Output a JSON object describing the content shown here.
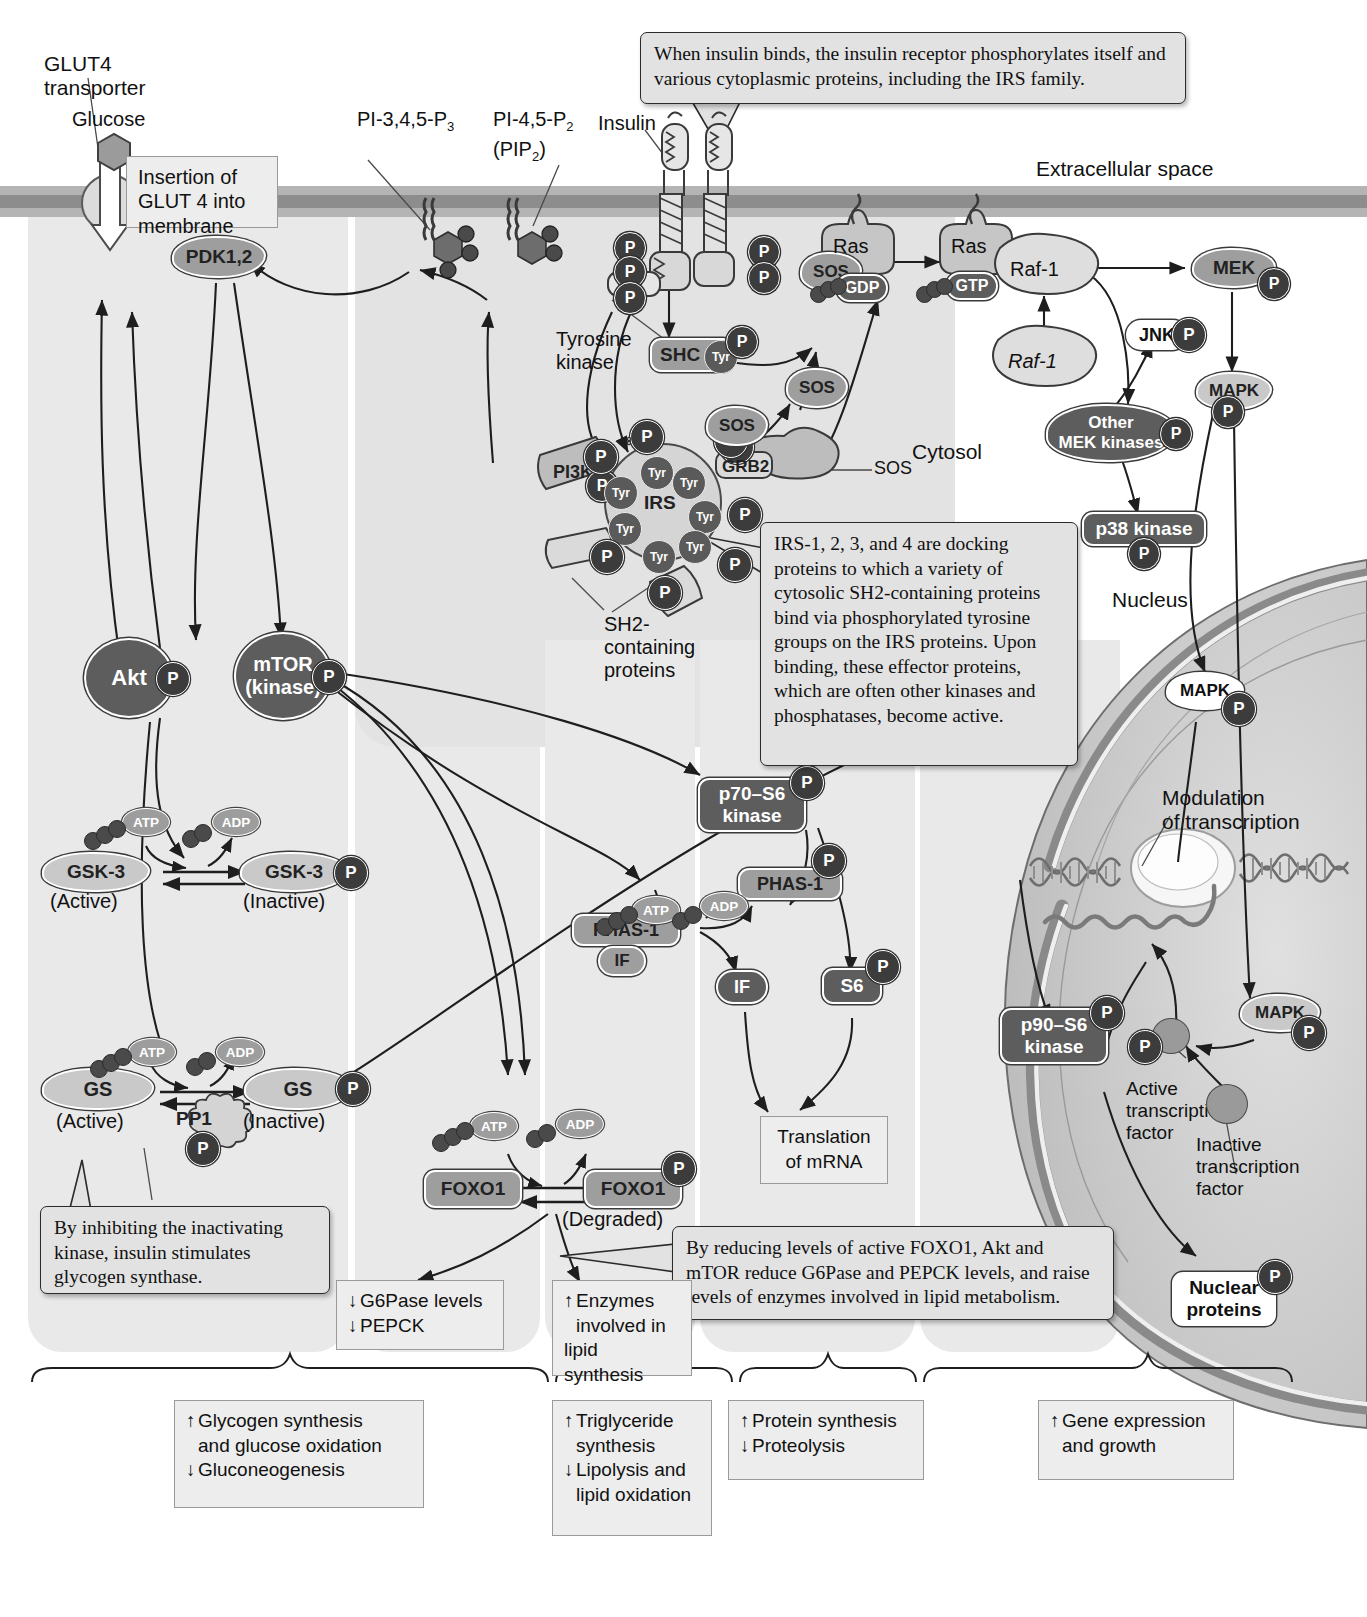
{
  "figure": {
    "regions": {
      "extracellular": "Extracellular space",
      "cytosol": "Cytosol",
      "nucleus": "Nucleus"
    }
  },
  "labels": {
    "glut4_transporter": "GLUT4\ntransporter",
    "glucose": "Glucose",
    "pip3": "PI-3,4,5-P",
    "pip3_sub": "3",
    "pip2": "PI-4,5-P",
    "pip2_sub": "2",
    "pip2_alt": "(PIP",
    "pip2_alt_sub": "2",
    "pip2_alt_end": ")",
    "insulin": "Insulin",
    "tyrosine_kinase": "Tyrosine\nkinase",
    "sh2_proteins": "SH2-\ncontaining\nproteins",
    "sos_pointer": "SOS",
    "modulation": "Modulation\nof transcription",
    "active_tf": "Active\ntranscription\nfactor",
    "inactive_tf": "Inactive\ntranscription\nfactor",
    "gsk3_active": "(Active)",
    "gsk3_inactive": "(Inactive)",
    "gs_active": "(Active)",
    "gs_inactive": "(Inactive)",
    "foxo1_degraded": "(Degraded)"
  },
  "callouts": [
    {
      "id": "insulin-receptor-callout",
      "text": "When insulin binds, the insulin receptor phosphorylates itself and various cytoplasmic proteins, including the IRS family."
    },
    {
      "id": "glut4-callout",
      "text": "Insertion of GLUT 4 into membrane"
    },
    {
      "id": "irs-callout",
      "text": "IRS-1, 2, 3, and 4 are docking proteins to which a variety of cytosolic SH2-containing proteins bind via phosphorylated tyrosine groups on the IRS proteins. Upon binding, these effector proteins, which are often other kinases and phosphatases, become active."
    },
    {
      "id": "glycogen-synthase-callout",
      "text": "By inhibiting the inactivating kinase, insulin stimulates glycogen synthase."
    },
    {
      "id": "foxo1-callout",
      "text": "By reducing levels of active FOXO1, Akt and mTOR reduce G6Pase and PEPCK levels, and raise levels of enzymes involved in lipid metabolism."
    }
  ],
  "proteins": [
    {
      "id": "pdk12",
      "label": "PDK1,2",
      "shade": "mid"
    },
    {
      "id": "akt",
      "label": "Akt",
      "shade": "dark",
      "phospho": true
    },
    {
      "id": "mtor",
      "label": "mTOR\n(kinase)",
      "shade": "dark",
      "phospho": true
    },
    {
      "id": "pi3k",
      "label": "PI3K",
      "shade": "mid",
      "phospho": true
    },
    {
      "id": "irs",
      "label": "IRS",
      "shade": "light"
    },
    {
      "id": "grb2",
      "label": "GRB2",
      "shade": "light",
      "phospho": true
    },
    {
      "id": "shc",
      "label": "SHC",
      "badge": "Tyr",
      "shade": "mid",
      "phospho": true
    },
    {
      "id": "sos",
      "label": "SOS",
      "shade": "mid"
    },
    {
      "id": "ras_gdp",
      "label": "Ras",
      "nucleotide": "GDP",
      "shade": "light"
    },
    {
      "id": "ras_gtp",
      "label": "Ras",
      "nucleotide": "GTP",
      "shade": "light"
    },
    {
      "id": "raf1_active",
      "label": "Raf-1",
      "shade": "light"
    },
    {
      "id": "raf1_inactive",
      "label": "Raf-1",
      "shade": "light"
    },
    {
      "id": "mek",
      "label": "MEK",
      "shade": "mid",
      "phospho": true
    },
    {
      "id": "jnk",
      "label": "JNK",
      "shade": "white",
      "phospho": true
    },
    {
      "id": "other_mek_kinases",
      "label": "Other\nMEK kinases",
      "shade": "dark",
      "phospho": true
    },
    {
      "id": "p38_kinase",
      "label": "p38 kinase",
      "shade": "dark",
      "phospho": true
    },
    {
      "id": "mapk_cyto",
      "label": "MAPK",
      "shade": "light",
      "phospho": true
    },
    {
      "id": "mapk_nuc_upper",
      "label": "MAPK",
      "shade": "white",
      "phospho": true
    },
    {
      "id": "mapk_nuc_lower",
      "label": "MAPK",
      "shade": "light",
      "phospho": true
    },
    {
      "id": "p70s6_kinase",
      "label": "p70–S6\nkinase",
      "shade": "dark",
      "phospho": true
    },
    {
      "id": "p90s6_kinase",
      "label": "p90–S6\nkinase",
      "shade": "dark",
      "phospho": true
    },
    {
      "id": "phas1_if",
      "label": "PHAS-1",
      "sub": "IF",
      "shade": "mid"
    },
    {
      "id": "phas1_p",
      "label": "PHAS-1",
      "shade": "mid",
      "phospho": true
    },
    {
      "id": "if",
      "label": "IF",
      "shade": "dark"
    },
    {
      "id": "s6",
      "label": "S6",
      "shade": "dark",
      "phospho": true
    },
    {
      "id": "gsk3_active",
      "label": "GSK-3",
      "shade": "light"
    },
    {
      "id": "gsk3_p",
      "label": "GSK-3",
      "shade": "light",
      "phospho": true
    },
    {
      "id": "gs_active",
      "label": "GS",
      "shade": "light"
    },
    {
      "id": "gs_p",
      "label": "GS",
      "shade": "light",
      "phospho": true
    },
    {
      "id": "pp1",
      "label": "PP1",
      "shade": "light",
      "phospho": true
    },
    {
      "id": "foxo1",
      "label": "FOXO1",
      "shade": "mid"
    },
    {
      "id": "foxo1_p",
      "label": "FOXO1",
      "shade": "mid",
      "phospho": true
    },
    {
      "id": "nuclear_proteins",
      "label": "Nuclear\nproteins",
      "shade": "white",
      "phospho": true
    }
  ],
  "nucleotides": {
    "atp": "ATP",
    "adp": "ADP",
    "gdp": "GDP",
    "gtp": "GTP",
    "phosphate": "P",
    "tyr": "Tyr"
  },
  "outcome_boxes": [
    {
      "id": "translation",
      "lines": [
        {
          "arrow": "",
          "text": "Translation"
        },
        {
          "arrow": "",
          "text": "of mRNA"
        }
      ]
    },
    {
      "id": "g6pase",
      "lines": [
        {
          "arrow": "↓",
          "text": "G6Pase levels"
        },
        {
          "arrow": "↓",
          "text": "PEPCK"
        }
      ]
    },
    {
      "id": "lipid-synthesis",
      "lines": [
        {
          "arrow": "↑",
          "text": "Enzymes"
        },
        {
          "arrow": "",
          "text": "involved in"
        },
        {
          "arrow": "",
          "text": "lipid synthesis"
        }
      ]
    }
  ],
  "summary_boxes": [
    {
      "id": "glycogen-summary",
      "lines": [
        {
          "arrow": "↑",
          "text": "Glycogen synthesis"
        },
        {
          "arrow": "",
          "text": "and glucose oxidation"
        },
        {
          "arrow": "↓",
          "text": "Gluconeogenesis"
        }
      ]
    },
    {
      "id": "triglyceride-summary",
      "lines": [
        {
          "arrow": "↑",
          "text": "Triglyceride"
        },
        {
          "arrow": "",
          "text": "synthesis"
        },
        {
          "arrow": "↓",
          "text": "Lipolysis and"
        },
        {
          "arrow": "",
          "text": "lipid oxidation"
        }
      ]
    },
    {
      "id": "protein-summary",
      "lines": [
        {
          "arrow": "↑",
          "text": "Protein synthesis"
        },
        {
          "arrow": "↓",
          "text": "Proteolysis"
        }
      ]
    },
    {
      "id": "gene-summary",
      "lines": [
        {
          "arrow": "↑",
          "text": "Gene expression"
        },
        {
          "arrow": "",
          "text": "and growth"
        }
      ]
    }
  ],
  "colors": {
    "membrane_light": "#b4b4b4",
    "membrane_dark": "#8d8d8d",
    "callout_bg": "#e2e2e2",
    "protein_dark": "#5d5d5d",
    "protein_mid": "#9e9e9e",
    "protein_light": "#c9c9c9",
    "phosphate": "#3c3c3c",
    "nucleus": "#cfcfcf"
  }
}
